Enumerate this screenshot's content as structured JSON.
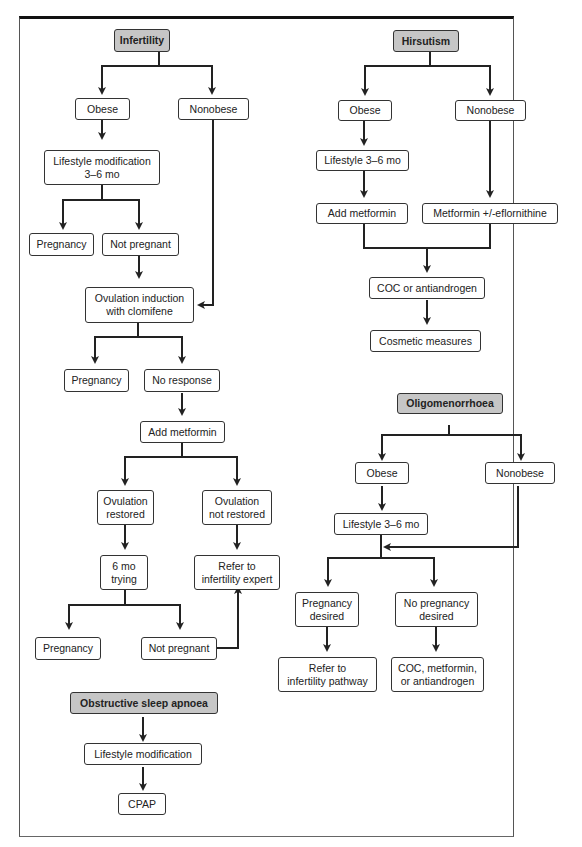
{
  "page": {
    "header_fragment": "... Copyright © ... Data information ..."
  },
  "flowcharts": {
    "infertility": {
      "title": "Infertility",
      "nodes": {
        "obese": "Obese",
        "nonobese": "Nonobese",
        "lifestyle": "Lifestyle modification\n3–6 mo",
        "pregnancy1": "Pregnancy",
        "not_pregnant1": "Not pregnant",
        "ovulation_induction": "Ovulation induction\nwith clomifene",
        "pregnancy2": "Pregnancy",
        "no_response": "No response",
        "add_metformin": "Add metformin",
        "ovulation_restored": "Ovulation\nrestored",
        "ovulation_not_restored": "Ovulation\nnot restored",
        "six_mo_trying": "6 mo\ntrying",
        "refer_expert": "Refer to\ninfertility expert",
        "pregnancy3": "Pregnancy",
        "not_pregnant2": "Not pregnant"
      }
    },
    "hirsutism": {
      "title": "Hirsutism",
      "nodes": {
        "obese": "Obese",
        "nonobese": "Nonobese",
        "lifestyle": "Lifestyle 3–6 mo",
        "add_metformin": "Add metformin",
        "metformin_eflornithine": "Metformin +/-eflornithine",
        "coc_antiandrogen": "COC or antiandrogen",
        "cosmetic": "Cosmetic measures"
      }
    },
    "oligomenorrhoea": {
      "title": "Oligomenorrhoea",
      "nodes": {
        "obese": "Obese",
        "nonobese": "Nonobese",
        "lifestyle": "Lifestyle 3–6 mo",
        "pregnancy_desired": "Pregnancy\ndesired",
        "no_pregnancy_desired": "No pregnancy\ndesired",
        "refer_pathway": "Refer to\ninfertility pathway",
        "coc_metformin": "COC, metformin,\nor antiandrogen"
      }
    },
    "sleep_apnoea": {
      "title": "Obstructive sleep apnoea",
      "nodes": {
        "lifestyle": "Lifestyle modification",
        "cpap": "CPAP"
      }
    }
  },
  "colors": {
    "header_fill": "#c6c6c6",
    "line": "#333333",
    "frame_top": "#111111"
  }
}
